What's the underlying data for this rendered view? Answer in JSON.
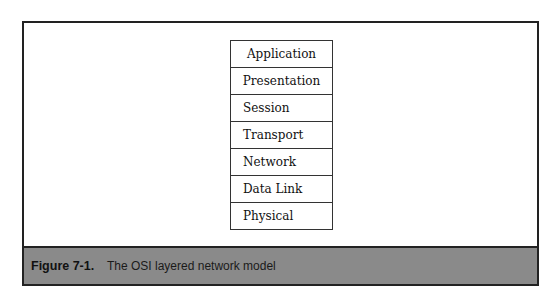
{
  "figure": {
    "number": "Figure 7-1.",
    "caption": "The OSI layered network model",
    "caption_bg_color": "#8a8a8a"
  },
  "osi_layers": [
    {
      "label": "Application"
    },
    {
      "label": "Presentation"
    },
    {
      "label": "Session"
    },
    {
      "label": "Transport"
    },
    {
      "label": "Network"
    },
    {
      "label": "Data Link"
    },
    {
      "label": "Physical"
    }
  ]
}
